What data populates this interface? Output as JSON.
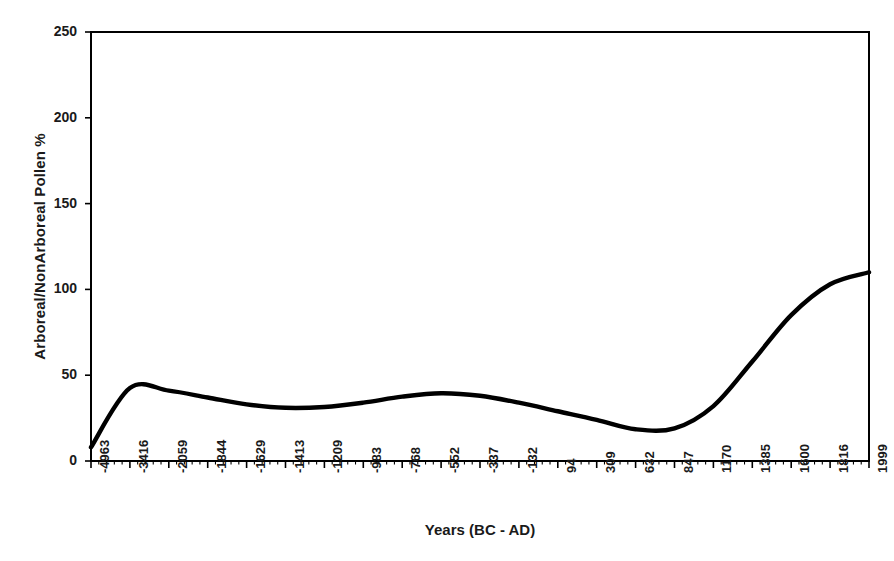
{
  "chart_data": {
    "type": "line",
    "title": "",
    "xlabel": "Years (BC - AD)",
    "ylabel": "Arboreal/NonArboreal Pollen %",
    "ylim": [
      0,
      250
    ],
    "yticks": [
      0,
      50,
      100,
      150,
      200,
      250
    ],
    "ytick_labels": [
      "0",
      "50",
      "100",
      "150",
      "200",
      "250"
    ],
    "grid": false,
    "legend": false,
    "legend_position": "none",
    "categories": [
      "-4963",
      "-3416",
      "-2059",
      "-1844",
      "-1629",
      "-1413",
      "-1209",
      "-983",
      "-768",
      "-552",
      "-337",
      "-132",
      "94",
      "309",
      "632",
      "847",
      "1170",
      "1385",
      "1600",
      "1816",
      "1999"
    ],
    "series": [
      {
        "name": "Arboreal/NonArboreal Pollen %",
        "color": "#000000",
        "values": [
          8,
          42.5,
          41,
          37,
          33,
          31,
          31.5,
          34,
          37.5,
          39.5,
          38,
          34,
          29,
          24,
          18.5,
          19,
          32,
          58,
          85,
          103,
          110
        ]
      }
    ]
  },
  "axes": {
    "x_axis_name": "years-axis",
    "y_axis_name": "pollen-percent-axis"
  }
}
